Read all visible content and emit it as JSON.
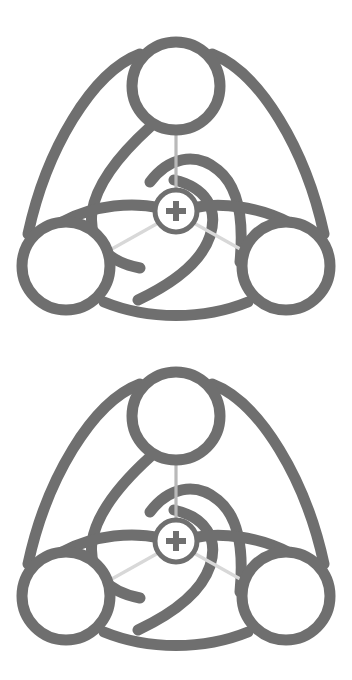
{
  "document": {
    "title": "Trefoil Rotor Symbol Sheet",
    "background_color": "#ffffff",
    "width": 352,
    "height": 680,
    "figure_count": 2,
    "description": "Two identical monochrome geometric line-art symbols stacked vertically on a plain white background."
  },
  "palette": {
    "stroke": "#6f6f6f",
    "stroke_alt": "#757575",
    "spoke": "#b9b9b9",
    "spoke_highlight": "#d8d8d8",
    "background": "#ffffff",
    "hub_fill": "#ffffff",
    "plus": "#6f6f6f"
  },
  "figure": {
    "name": "trefoil-rotor-symbol",
    "stroke_width": 11,
    "spoke_width": 3.2,
    "outer_circles": [
      {
        "id": "circle-top",
        "label": "top node",
        "cx": 176,
        "cy": 76,
        "r": 44
      },
      {
        "id": "circle-bottom-left",
        "label": "bottom left node",
        "cx": 66,
        "cy": 256,
        "r": 44
      },
      {
        "id": "circle-bottom-right",
        "label": "bottom right node",
        "cx": 286,
        "cy": 256,
        "r": 44
      }
    ],
    "hub": {
      "id": "center-hub",
      "label": "center hub",
      "cx": 176,
      "cy": 201,
      "r": 21,
      "glyph": "plus"
    },
    "plus_glyph": {
      "arm_length": 20,
      "arm_thickness": 6
    },
    "outer_arcs": [
      {
        "id": "outer-arc-left",
        "label": "upper left outer arc"
      },
      {
        "id": "outer-arc-right",
        "label": "upper right outer arc"
      },
      {
        "id": "outer-arc-bottom",
        "label": "bottom outer arc"
      }
    ],
    "inner_arcs": [
      {
        "id": "inner-arc-a",
        "label": "inner spiral arc a"
      },
      {
        "id": "inner-arc-b",
        "label": "inner spiral arc b"
      },
      {
        "id": "inner-arc-c",
        "label": "inner spiral arc c"
      }
    ],
    "spokes": [
      {
        "id": "spoke-top",
        "label": "hub to top node spoke",
        "angle_deg": 270
      },
      {
        "id": "spoke-bottom-left",
        "label": "hub to bottom left node spoke",
        "angle_deg": 150
      },
      {
        "id": "spoke-bottom-right",
        "label": "hub to bottom right node spoke",
        "angle_deg": 30
      }
    ]
  },
  "figures": [
    {
      "id": "figure-top",
      "label": "Upper trefoil rotor symbol"
    },
    {
      "id": "figure-bottom",
      "label": "Lower trefoil rotor symbol"
    }
  ]
}
